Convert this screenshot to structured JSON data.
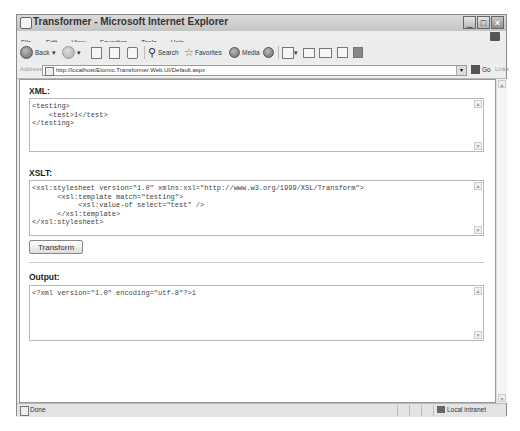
{
  "window": {
    "title": "Transformer - Microsoft Internet Explorer",
    "controls": [
      "minimize",
      "maximize",
      "close"
    ]
  },
  "menubar": {
    "items": [
      "File",
      "Edit",
      "View",
      "Favorites",
      "Tools",
      "Help"
    ]
  },
  "toolbar": {
    "back_label": "Back",
    "search_label": "Search",
    "favorites_label": "Favorites",
    "media_label": "Media"
  },
  "address_bar": {
    "label": "Address",
    "url": "http://localhost/Etomic.Transformer.Web.UI/Default.aspx",
    "go_label": "Go",
    "links_label": "Links"
  },
  "page": {
    "xml": {
      "label": "XML:",
      "value": "<testing>\n    <test>1</test>\n</testing>"
    },
    "xslt": {
      "label": "XSLT:",
      "value": "<xsl:stylesheet version=\"1.0\" xmlns:xsl=\"http://www.w3.org/1999/XSL/Transform\">\n      <xsl:template match=\"testing\">\n           <xsl:value-of select=\"test\" />\n      </xsl:template>\n</xsl:stylesheet>"
    },
    "transform_button": "Transform",
    "output": {
      "label": "Output:",
      "value": "<?xml version=\"1.0\" encoding=\"utf-8\"?>1"
    }
  },
  "statusbar": {
    "status": "Done",
    "zone": "Local intranet"
  }
}
